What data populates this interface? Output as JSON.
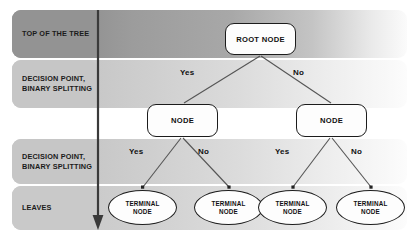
{
  "diagram": {
    "stripes": [
      {
        "id": "top-of-the-tree",
        "label": "TOP OF THE TREE",
        "color": "#939393"
      },
      {
        "id": "decision-point-1",
        "label": "DECISION POINT,\nBINARY SPLITTING",
        "color": "#c6c6c6"
      },
      {
        "id": "decision-point-2",
        "label": "DECISION POINT,\nBINARY SPLITTING",
        "color": "#c6c6c6"
      },
      {
        "id": "leaves",
        "label": "LEAVES",
        "color": "#c9c9c9"
      }
    ],
    "nodes": {
      "root": {
        "label": "ROOT NODE"
      },
      "node_left": {
        "label": "NODE"
      },
      "node_right": {
        "label": "NODE"
      },
      "terminals": [
        {
          "label": "TERMINAL\nNODE"
        },
        {
          "label": "TERMINAL\nNODE"
        },
        {
          "label": "TERMINAL\nNODE"
        },
        {
          "label": "TERMINAL\nNODE"
        }
      ]
    },
    "branches": {
      "root_yes": "Yes",
      "root_no": "No",
      "left_yes": "Yes",
      "left_no": "No",
      "right_yes": "Yes",
      "right_no": "No"
    },
    "flow_arrow": {
      "name": "depth-direction-arrow",
      "direction": "down"
    },
    "colors": {
      "node_border": "#1c1c1c",
      "node_fill": "#fdfdfd",
      "text": "#111111",
      "connector": "#555555",
      "arrow": "#3a3a3a"
    }
  }
}
